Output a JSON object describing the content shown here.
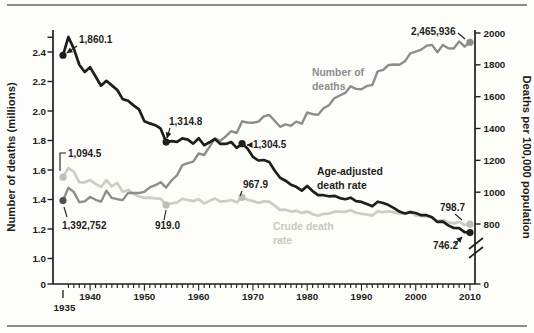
{
  "figure": {
    "background": "#fdfdfa",
    "rule_color": "#8c8c8c",
    "axis_color": "#1e1e1c",
    "annotation_color": "#1e1e1c"
  },
  "chart_data": {
    "type": "line",
    "title": "",
    "x_range": [
      1935,
      2010
    ],
    "grid": false,
    "left_axis": {
      "label": "Number of deaths (millions)",
      "units": "millions of deaths",
      "range_shown": [
        1.0,
        2.4
      ],
      "has_zero_baseline": true,
      "ticks": [
        {
          "label": "2.4",
          "v": 2.4
        },
        {
          "label": "2.2",
          "v": 2.2
        },
        {
          "label": "2.0",
          "v": 2.0
        },
        {
          "label": "1.8",
          "v": 1.8
        },
        {
          "label": "1.6",
          "v": 1.6
        },
        {
          "label": "1.4",
          "v": 1.4
        },
        {
          "label": "1.2",
          "v": 1.2
        },
        {
          "label": "1.0",
          "v": 1.0
        },
        {
          "label": "0",
          "v": null
        }
      ]
    },
    "right_axis": {
      "label": "Deaths per 100,000 population",
      "units": "deaths per 100,000 population",
      "range_shown": [
        800,
        2000
      ],
      "axis_break": true,
      "ticks": [
        {
          "label": "2000",
          "v": 2000
        },
        {
          "label": "1800",
          "v": 1800
        },
        {
          "label": "1600",
          "v": 1600
        },
        {
          "label": "1400",
          "v": 1400
        },
        {
          "label": "1200",
          "v": 1200
        },
        {
          "label": "1000",
          "v": 1000
        },
        {
          "label": "800",
          "v": 800
        },
        {
          "label": "0",
          "v": null
        }
      ]
    },
    "x_axis": {
      "first": {
        "label": "1935",
        "year": 1935
      },
      "decades": [
        {
          "label": "1940",
          "year": 1940
        },
        {
          "label": "1950",
          "year": 1950
        },
        {
          "label": "1960",
          "year": 1960
        },
        {
          "label": "1970",
          "year": 1970
        },
        {
          "label": "1980",
          "year": 1980
        },
        {
          "label": "1990",
          "year": 1990
        },
        {
          "label": "2000",
          "year": 2000
        },
        {
          "label": "2010",
          "year": 2010
        }
      ]
    },
    "series": [
      {
        "id": "deaths",
        "name": "Number of deaths",
        "axis": "left",
        "color": "#8d8d8d",
        "start_year": 1935,
        "values": [
          1.393,
          1.479,
          1.45,
          1.381,
          1.387,
          1.417,
          1.398,
          1.385,
          1.459,
          1.411,
          1.402,
          1.396,
          1.445,
          1.444,
          1.444,
          1.452,
          1.482,
          1.497,
          1.517,
          1.481,
          1.529,
          1.564,
          1.633,
          1.647,
          1.657,
          1.712,
          1.702,
          1.757,
          1.814,
          1.798,
          1.828,
          1.863,
          1.851,
          1.93,
          1.922,
          1.921,
          1.928,
          1.964,
          1.973,
          1.934,
          1.893,
          1.909,
          1.9,
          1.928,
          1.914,
          1.99,
          1.978,
          1.975,
          2.019,
          2.039,
          2.086,
          2.105,
          2.123,
          2.168,
          2.15,
          2.148,
          2.17,
          2.176,
          2.269,
          2.279,
          2.312,
          2.315,
          2.314,
          2.337,
          2.391,
          2.403,
          2.416,
          2.443,
          2.448,
          2.398,
          2.448,
          2.426,
          2.424,
          2.472,
          2.437,
          2.466
        ]
      },
      {
        "id": "age",
        "name": "Age-adjusted death rate",
        "axis": "right",
        "color": "#1e1e1c",
        "start_year": 1935,
        "values": [
          1860.1,
          1975,
          1900,
          1800,
          1755,
          1785,
          1727,
          1669,
          1700,
          1671,
          1642,
          1585,
          1574,
          1545,
          1520,
          1446,
          1432,
          1421,
          1399,
          1314.8,
          1320,
          1316,
          1338,
          1330,
          1305,
          1339,
          1295,
          1313,
          1334,
          1303,
          1303,
          1315,
          1278,
          1304.5,
          1275,
          1222,
          1199,
          1202,
          1190,
          1136,
          1090,
          1072,
          1047,
          1034,
          1010,
          1039,
          1007,
          981,
          981,
          974,
          977,
          963,
          956,
          965,
          944,
          939,
          925,
          911,
          940,
          932,
          919,
          899,
          878,
          866,
          875,
          869,
          855,
          855,
          843,
          813,
          815,
          791,
          775,
          774,
          749,
          746.2
        ]
      },
      {
        "id": "crude",
        "name": "Crude death rate",
        "axis": "right",
        "color": "#cccdc5",
        "start_year": 1935,
        "values": [
          1094.5,
          1152,
          1128,
          1062,
          1062,
          1076,
          1052,
          1033,
          1076,
          1036,
          1058,
          1002,
          1014,
          989,
          973,
          964,
          966,
          961,
          959,
          919.0,
          930,
          935,
          958,
          951,
          944,
          955,
          929,
          945,
          961,
          940,
          943,
          951,
          936,
          967.9,
          952,
          945,
          932,
          942,
          940,
          915,
          889,
          890,
          878,
          883,
          870,
          878,
          862,
          852,
          864,
          865,
          877,
          877,
          876,
          887,
          871,
          864,
          860,
          853,
          880,
          875,
          880,
          873,
          865,
          865,
          877,
          854,
          849,
          847,
          842,
          817,
          826,
          810,
          804,
          813,
          794,
          798.7
        ]
      }
    ],
    "marked_points": [
      {
        "series": "deaths",
        "year": 1935,
        "fill": "#4f4f4f"
      },
      {
        "series": "deaths",
        "year": 2010,
        "fill": "#8d8d8d"
      },
      {
        "series": "age",
        "year": 1935,
        "fill": "#1e1e1c"
      },
      {
        "series": "age",
        "year": 1954,
        "fill": "#1e1e1c"
      },
      {
        "series": "age",
        "year": 1968,
        "fill": "#1e1e1c"
      },
      {
        "series": "age",
        "year": 2010,
        "fill": "#1e1e1c"
      },
      {
        "series": "crude",
        "year": 1935,
        "fill": "#bfbfb6"
      },
      {
        "series": "crude",
        "year": 1954,
        "fill": "#bfbfb6"
      },
      {
        "series": "crude",
        "year": 1968,
        "fill": "#bfbfb6"
      },
      {
        "series": "crude",
        "year": 2010,
        "fill": "#bfbfb6"
      }
    ],
    "annotations": [
      {
        "text": "1,860.1",
        "x": 79,
        "y": 43,
        "leader": [
          [
            77,
            46
          ],
          [
            67,
            53
          ]
        ],
        "arrow": true
      },
      {
        "text": "1,314.8",
        "x": 169,
        "y": 125,
        "leader": [
          [
            170,
            128
          ],
          [
            167,
            138
          ]
        ],
        "arrow": true
      },
      {
        "text": "1,304.5",
        "x": 253,
        "y": 148,
        "leader": [
          [
            251,
            145
          ],
          [
            247,
            145
          ]
        ],
        "arrow": true
      },
      {
        "text": "2,465,936",
        "x": 411,
        "y": 35,
        "leader": [
          [
            458,
            33
          ],
          [
            465,
            39
          ]
        ],
        "arrow": false
      },
      {
        "text": "1,094.5",
        "x": 68,
        "y": 157,
        "leader": [
          [
            66,
            153
          ],
          [
            60,
            153
          ],
          [
            60,
            171
          ]
        ],
        "arrow": false
      },
      {
        "text": "1,392,752",
        "x": 62,
        "y": 229,
        "leader": [
          [
            64,
            207
          ],
          [
            67,
            217
          ]
        ],
        "arrow": false
      },
      {
        "text": "919.0",
        "x": 155,
        "y": 229,
        "leader": [
          [
            164,
            220
          ],
          [
            166,
            210
          ]
        ],
        "arrow": false
      },
      {
        "text": "967.9",
        "x": 243,
        "y": 188,
        "leader": [
          [
            242,
            191
          ],
          [
            240,
            196
          ]
        ],
        "arrow": false
      },
      {
        "text": "798.7",
        "x": 440,
        "y": 211,
        "leader": [
          [
            455,
            214
          ],
          [
            462,
            220
          ]
        ],
        "arrow": false
      },
      {
        "text": "746.2",
        "x": 433,
        "y": 249,
        "leader": [
          [
            455,
            244
          ],
          [
            462,
            237
          ]
        ],
        "arrow": true
      }
    ],
    "series_labels": [
      {
        "lines": [
          "Number of",
          "deaths"
        ],
        "x": 312,
        "y": 76,
        "lh": 14,
        "color": "#8d8d8d"
      },
      {
        "lines": [
          "Age-adjusted",
          "death rate"
        ],
        "x": 317,
        "y": 175,
        "lh": 14,
        "color": "#1e1e1c"
      },
      {
        "lines": [
          "Crude death",
          "rate"
        ],
        "x": 273,
        "y": 230,
        "lh": 14,
        "color": "#c9c9c0"
      }
    ]
  }
}
